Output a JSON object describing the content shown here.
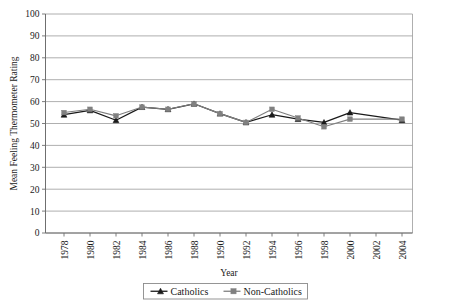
{
  "chart_data": {
    "type": "line",
    "title": "",
    "xlabel": "Year",
    "ylabel": "Mean Feeling Thermometer Rating",
    "categories": [
      "1978",
      "1980",
      "1982",
      "1984",
      "1986",
      "1988",
      "1990",
      "1992",
      "1994",
      "1996",
      "1998",
      "2000",
      "2002",
      "2004"
    ],
    "x_tick_labels": [
      "1978",
      "1980",
      "1982",
      "1984",
      "1986",
      "1988",
      "1990",
      "1992",
      "1994",
      "1996",
      "1998",
      "2000",
      "2002",
      "2004"
    ],
    "y_tick_labels": [
      "0",
      "10",
      "20",
      "30",
      "40",
      "50",
      "60",
      "70",
      "80",
      "90",
      "100"
    ],
    "y_ticks": [
      0,
      10,
      20,
      30,
      40,
      50,
      60,
      70,
      80,
      90,
      100
    ],
    "ylim": [
      0,
      100
    ],
    "grid": "horizontal",
    "legend_position": "bottom",
    "series": [
      {
        "name": "Catholics",
        "marker": "triangle",
        "color": "#1a1a1a",
        "values": [
          54.0,
          56.0,
          51.5,
          57.5,
          56.5,
          59.0,
          54.5,
          50.5,
          54.0,
          52.0,
          50.5,
          55.0,
          null,
          51.5
        ]
      },
      {
        "name": "Non-Catholics",
        "marker": "square",
        "color": "#808080",
        "values": [
          55.0,
          56.5,
          53.5,
          57.5,
          56.5,
          59.0,
          54.5,
          50.5,
          56.5,
          52.5,
          48.5,
          52.0,
          null,
          52.0
        ]
      }
    ]
  },
  "legend": {
    "items": [
      {
        "label": "Catholics",
        "marker": "triangle",
        "color": "#1a1a1a"
      },
      {
        "label": "Non-Catholics",
        "marker": "square",
        "color": "#808080"
      }
    ]
  },
  "axes": {
    "x_title": "Year",
    "y_title": "Mean Feeling Thermometer Rating"
  },
  "colors": {
    "catholics": "#1a1a1a",
    "non_catholics": "#808080",
    "gridline": "#9a9a9a",
    "axis": "#6f6f6f",
    "background": "#ffffff"
  }
}
